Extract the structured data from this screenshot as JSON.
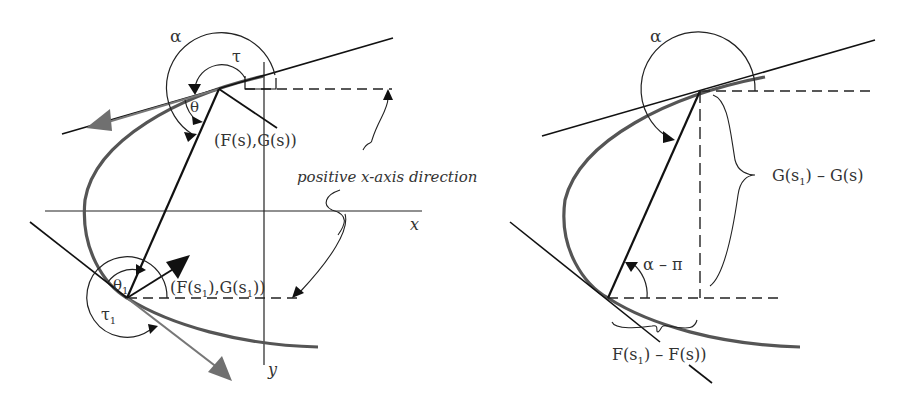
{
  "left_panel": {
    "labels": {
      "alpha": "α",
      "tau": "τ",
      "theta": "θ",
      "point_s": "(F(s),G(s))",
      "annotation": "positive x-axis direction",
      "x_axis": "x",
      "y_axis": "y",
      "theta1": "θ",
      "theta1_sub": "1",
      "tau1": "τ",
      "tau1_sub": "1",
      "point_s1": "(F(s",
      "point_s1_mid": "),G(s",
      "point_s1_end": "))",
      "sub1": "1"
    }
  },
  "right_panel": {
    "labels": {
      "alpha": "α",
      "g_diff": "G(s",
      "g_diff_end": ") – G(s)",
      "alpha_minus_pi": "α – π",
      "f_diff": "F(s",
      "f_diff_end": ") – F(s))",
      "sub1": "1"
    }
  },
  "colors": {
    "line": "#1a1a1a",
    "curve": "#555555",
    "arrow_gray": "#777777"
  }
}
